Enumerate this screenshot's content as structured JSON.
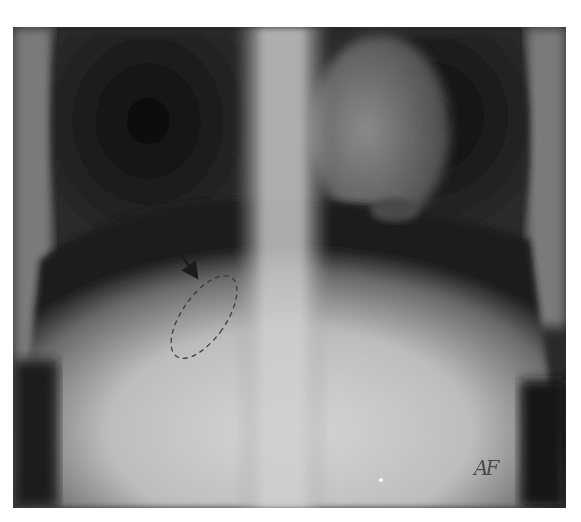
{
  "image": {
    "type": "radiograph",
    "view": "frontal chest/upper abdomen X-ray",
    "background_color": "#ffffff",
    "frame": {
      "x": 13,
      "y": 27,
      "width": 553,
      "height": 481
    }
  },
  "annotations": {
    "arrow": {
      "name": "pointer-arrow",
      "from": [
        180,
        253
      ],
      "to": [
        198,
        279
      ],
      "color": "#1a1a1a"
    },
    "ellipse": {
      "name": "dashed-region",
      "cx": 204,
      "cy": 317,
      "rx": 22,
      "ry": 48,
      "rotation_deg": 35,
      "stroke": "#3c3c3c",
      "dash": "5,4"
    },
    "side_marker": {
      "text": "AF"
    },
    "small_bright_spot": {
      "x": 381,
      "y": 480
    }
  }
}
